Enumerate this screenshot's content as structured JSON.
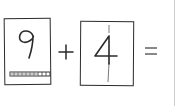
{
  "worksheet": {
    "equation": {
      "left_operand": {
        "value": "9",
        "strip_segments": 10
      },
      "operator": "+",
      "right_operand": {
        "value": "4"
      },
      "equals": "=",
      "answer": ""
    },
    "colors": {
      "ink": "#2a2a2a",
      "light_ink": "#7a7a7a",
      "divider": "#cfcfcf",
      "background": "#ffffff"
    }
  }
}
